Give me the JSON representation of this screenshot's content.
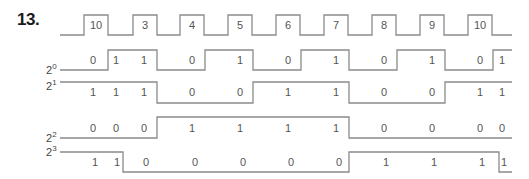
{
  "problem_number": "13.",
  "signals": {
    "clock": {
      "name": "clock",
      "pulse_labels": [
        "10",
        "3",
        "4",
        "5",
        "6",
        "7",
        "8",
        "9",
        "10"
      ]
    },
    "q0": {
      "label_base": "2",
      "label_exp": "0",
      "values": [
        "0",
        "1",
        "1",
        "0",
        "1",
        "0",
        "1",
        "0",
        "1",
        "0",
        "1"
      ]
    },
    "q1": {
      "label_base": "2",
      "label_exp": "1",
      "values": [
        "1",
        "1",
        "1",
        "0",
        "0",
        "1",
        "1",
        "0",
        "0",
        "1",
        "1"
      ]
    },
    "q2": {
      "label_base": "2",
      "label_exp": "2",
      "values": [
        "0",
        "0",
        "0",
        "1",
        "1",
        "1",
        "1",
        "0",
        "0",
        "0",
        "0"
      ]
    },
    "q3": {
      "label_base": "2",
      "label_exp": "3",
      "values": [
        "1",
        "1",
        "0",
        "0",
        "0",
        "0",
        "0",
        "1",
        "1",
        "1",
        "1"
      ]
    }
  },
  "colors": {
    "waveform": "#8a8a8a",
    "text": "#555555",
    "title": "#1a1a1a"
  }
}
